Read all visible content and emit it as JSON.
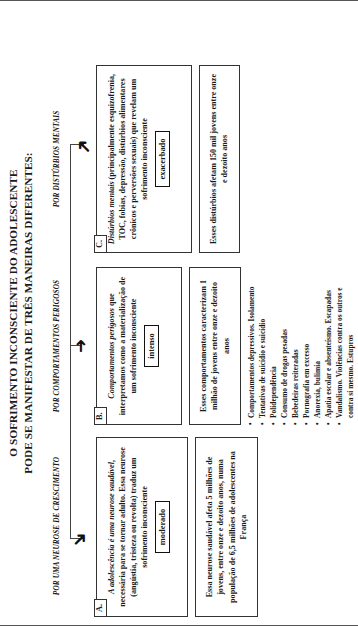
{
  "diagram": {
    "title_line1": "O SOFRIMENTO INCONSCIENTE DO ADOLESCENTE",
    "title_line2": "PODE SE MANIFESTAR DE TRÊS MANEIRAS DIFERENTES:",
    "columns": [
      {
        "id": "a",
        "heading": "POR UMA NEUROSE DE CRESCIMENTO"
      },
      {
        "id": "b",
        "heading": "POR COMPORTAMENTOS PERIGOSOS"
      },
      {
        "id": "c",
        "heading": "POR DISTÚRBIOS MENTAIS"
      }
    ],
    "branches": [
      {
        "tag": "A.",
        "lead_italic": "A adolescência é uma neurose saudável",
        "lead_rest": ", necessária para se tornar adulto. Essa neurose (angústia, tristeza ou revolta) traduz um sofrimento inconsciente",
        "intensity": "moderado",
        "detail": "Essa neurose saudável afeta 5 milhões de jovens, entre onze e dezoito anos, numa população de 6,5 milhões de adolescentes na França",
        "bullets": []
      },
      {
        "tag": "B.",
        "lead_italic": "Comportamentos perigosos",
        "lead_rest": " que interpretamos como a materialização de um sofrimento inconsciente",
        "intensity": "intenso",
        "detail": "Esses comportamentos caracterizam 1 milhão de jovens entre onze e dezoito anos",
        "bullets": [
          "Comportamentos depressivos. Isolamento",
          "Tentativas de suicídio e suicídio",
          "Polidependência",
          "Consumo de drogas pesadas",
          "Bebedeiras reiteradas",
          "Pornografia em excesso",
          "Anorexia, bulimia",
          "Apatia escolar e absenteísmo. Escapadas",
          "Vandalismo. Violências contra os outros e contra si mesmo. Estupros"
        ]
      },
      {
        "tag": "C.",
        "lead_italic": "Distúrbios mentais",
        "lead_rest": " (principalmente esquizofrenia, TOC, fobias, depressão, distúrbios alimentares crônicos e perversões sexuais) que revelam um sofrimento inconsciente",
        "intensity": "exacerbado",
        "detail": "Esses distúrbios afetam 150 mil jovens entre onze e dezoito anos",
        "bullets": []
      }
    ],
    "icons": {
      "arrow_a": "arrow-down-right-icon",
      "arrow_b": "arrow-right-icon",
      "arrow_c": "arrow-up-right-icon"
    }
  }
}
